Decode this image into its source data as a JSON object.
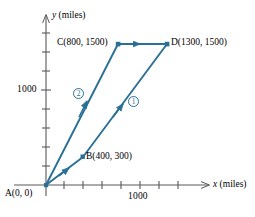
{
  "figure": {
    "axes": {
      "x_label": "x (miles)",
      "x_label_italic_part": "x",
      "x_label_rest": " (miles)",
      "y_label": "y (miles)",
      "y_label_italic_part": "y",
      "y_label_rest": " (miles)",
      "x_tick_label": "1000",
      "y_tick_label": "1000",
      "x_tick_count": 8,
      "y_tick_count": 9,
      "tick_spacing_miles": 200,
      "grid": false
    },
    "points": [
      {
        "id": "A",
        "label": "A(0, 0)",
        "x": 0,
        "y": 0
      },
      {
        "id": "B",
        "label": "B(400, 300)",
        "x": 400,
        "y": 300
      },
      {
        "id": "C",
        "label": "C(800, 1500)",
        "x": 800,
        "y": 1500
      },
      {
        "id": "D",
        "label": "D(1300, 1500)",
        "x": 1300,
        "y": 1500
      }
    ],
    "routes": [
      {
        "id": "1",
        "marker": "①",
        "from": "A",
        "via": "B",
        "to": "D"
      },
      {
        "id": "2",
        "marker": "②",
        "from": "A",
        "via": "C",
        "to": "D"
      }
    ],
    "colors": {
      "vector": "#2a6f96",
      "axis": "#585858",
      "text": "#000000"
    }
  }
}
